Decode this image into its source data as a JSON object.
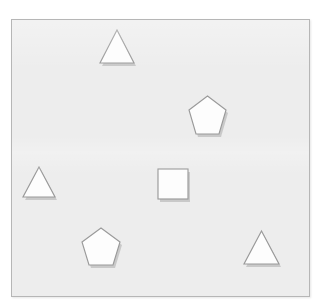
{
  "scene": {
    "title": "Geometric shapes canvas",
    "width": 323,
    "height": 308,
    "background_color": "#ffffff"
  },
  "canvas": {
    "name": "shape-canvas",
    "x": 11,
    "y": 19,
    "width": 299,
    "height": 278,
    "fill_color": "#ededed",
    "border_color": "#b6b6b6",
    "border_width": 1
  },
  "style": {
    "shape_fill": "#fdfdfd",
    "shape_stroke": "#9a9a9a",
    "shape_stroke_width": 1.15,
    "shadow_color": "rgba(120,120,120,0.30)",
    "shadow_offset_x": 2,
    "shadow_offset_y": 3
  },
  "counts": {
    "total": 6,
    "triangle": 3,
    "pentagon": 2,
    "square": 1
  },
  "shapes": [
    {
      "id": "triangle-top",
      "type": "triangle",
      "label": "Triangle",
      "x": 97,
      "y": 28,
      "width": 36,
      "height": 34,
      "center_x": 115,
      "center_y": 45
    },
    {
      "id": "pentagon-upper-right",
      "type": "pentagon",
      "label": "Pentagon",
      "x": 187,
      "y": 94,
      "width": 37,
      "height": 41,
      "center_x": 205,
      "center_y": 114
    },
    {
      "id": "triangle-left",
      "type": "triangle",
      "label": "Triangle",
      "x": 21,
      "y": 165,
      "width": 34,
      "height": 31,
      "center_x": 38,
      "center_y": 180
    },
    {
      "id": "square-center",
      "type": "square",
      "label": "Square",
      "x": 156,
      "y": 167,
      "width": 30,
      "height": 30,
      "center_x": 171,
      "center_y": 182
    },
    {
      "id": "pentagon-bottom-left",
      "type": "pentagon",
      "label": "Pentagon",
      "x": 80,
      "y": 226,
      "width": 38,
      "height": 39,
      "center_x": 99,
      "center_y": 245
    },
    {
      "id": "triangle-bottom-right",
      "type": "triangle",
      "label": "Triangle",
      "x": 243,
      "y": 229,
      "width": 35,
      "height": 34,
      "center_x": 260,
      "center_y": 246
    }
  ]
}
